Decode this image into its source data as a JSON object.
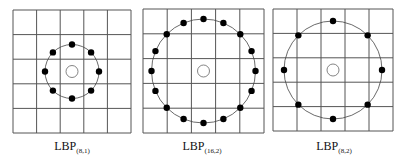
{
  "figure": {
    "panels": [
      {
        "id": "lbp-8-1",
        "label_main": "LBP",
        "label_sub": "(8,1)",
        "points": 8,
        "radius": 1,
        "grid_cells": 5
      },
      {
        "id": "lbp-16-2",
        "label_main": "LBP",
        "label_sub": "(16,2)",
        "points": 16,
        "radius": 2,
        "grid_cells": 5
      },
      {
        "id": "lbp-8-2",
        "label_main": "LBP",
        "label_sub": "(8,2)",
        "points": 8,
        "radius": 2,
        "grid_cells": 5
      }
    ],
    "colors": {
      "grid": "#555555",
      "circle": "#444444",
      "point": "#000000",
      "center": "#666666"
    }
  }
}
